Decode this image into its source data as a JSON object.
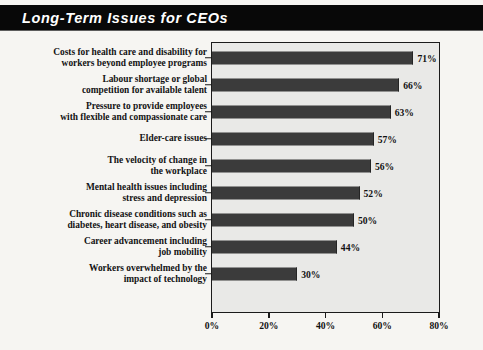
{
  "title": "Long-Term Issues for CEOs",
  "chart_data": {
    "type": "bar",
    "orientation": "horizontal",
    "title": "Long-Term Issues for CEOs",
    "xlabel": "",
    "ylabel": "",
    "xlim": [
      0,
      80
    ],
    "grid": false,
    "legend": null,
    "xticks": [
      "0%",
      "20%",
      "40%",
      "60%",
      "80%"
    ],
    "xtick_values": [
      0,
      20,
      40,
      60,
      80
    ],
    "categories": [
      "Costs for health care and disability for\nworkers beyond employee programs",
      "Labour shortage or global\ncompetition for available talent",
      "Pressure to provide employees\nwith flexible and compassionate care",
      "Elder-care issues",
      "The velocity of change in\nthe workplace",
      "Mental health issues including\nstress and depression",
      "Chronic disease conditions such as\ndiabetes, heart disease, and obesity",
      "Career advancement including\njob mobility",
      "Workers overwhelmed by the\nimpact of technology"
    ],
    "values": [
      71,
      66,
      63,
      57,
      56,
      52,
      50,
      44,
      30
    ],
    "value_labels": [
      "71%",
      "66%",
      "63%",
      "57%",
      "56%",
      "52%",
      "50%",
      "44%",
      "30%"
    ],
    "colors": {
      "bar": "#3b3b3b",
      "plot_background": "#e9e9e7",
      "page_background": "#f6f5f2",
      "axis": "#1b1b1b",
      "title_background": "#080808",
      "title_text": "#ffffff"
    }
  }
}
